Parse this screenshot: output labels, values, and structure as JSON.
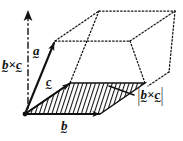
{
  "figure": {
    "kind": "vector-parallelepiped-diagram",
    "width": 183,
    "height": 141,
    "background_color": "#ffffff",
    "ink_color": "#111111"
  },
  "labels": {
    "axis_vector": {
      "name": "b-cross-c-direction",
      "parts": [
        "b",
        "×",
        "c"
      ],
      "base": "b",
      "operator": "×",
      "second": "c",
      "tilde": "∼",
      "text": "b×c",
      "meaning": "direction of the vector product b cross c"
    },
    "magnitude": {
      "name": "b-cross-c-magnitude",
      "open_bar": "|",
      "close_bar": "|",
      "base": "b",
      "operator": "×",
      "second": "c",
      "tilde": "∼",
      "text": "|b×c|",
      "meaning": "area of the shaded base parallelogram"
    },
    "vector_a": {
      "name": "vector-a",
      "glyph": "a",
      "tilde": "∼",
      "text": "a"
    },
    "vector_c": {
      "name": "vector-c",
      "glyph": "c",
      "tilde": "∼",
      "text": "c"
    },
    "vector_b": {
      "name": "vector-b",
      "glyph": "b",
      "tilde": "∼",
      "text": "b"
    }
  },
  "geometry": {
    "origin": [
      25,
      114
    ],
    "vector_a_tip": [
      55,
      41
    ],
    "vector_b_tip": [
      100,
      114
    ],
    "vector_c_tip": [
      70,
      83
    ],
    "base_parallelogram": [
      [
        25,
        114
      ],
      [
        100,
        114
      ],
      [
        145,
        83
      ],
      [
        70,
        83
      ]
    ],
    "top_parallelogram": [
      [
        55,
        41
      ],
      [
        130,
        41
      ],
      [
        175,
        11
      ],
      [
        99,
        11
      ]
    ],
    "axis_arrow": {
      "from": [
        28,
        96
      ],
      "to": [
        28,
        15
      ],
      "style": "dash-dot"
    },
    "leader_line": {
      "from": [
        134,
        95
      ],
      "to": [
        110,
        86
      ]
    },
    "hatch_spacing_px": 4,
    "hatch_angle_deg": 72
  }
}
